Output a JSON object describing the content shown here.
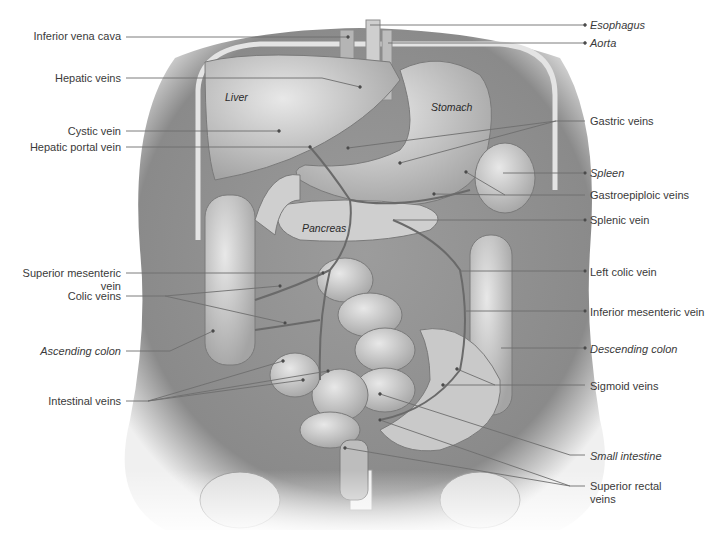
{
  "figure": {
    "title_visible": false,
    "colors": {
      "leader_line": "#6e6e6e",
      "label_text": "#3a3a3a",
      "illustration_dark": "#7a7a7a",
      "illustration_mid": "#a9a9a9",
      "illustration_light": "#d9d9d9",
      "background": "#ffffff"
    }
  },
  "organ_labels": [
    {
      "text": "Liver",
      "x": 225,
      "y": 91
    },
    {
      "text": "Stomach",
      "x": 431,
      "y": 101
    },
    {
      "text": "Pancreas",
      "x": 302,
      "y": 222
    }
  ],
  "labels_left": [
    {
      "text": "Inferior vena cava",
      "italic": false,
      "right": 121,
      "y": 30,
      "line": [
        126,
        37,
        348,
        37
      ]
    },
    {
      "text": "Hepatic veins",
      "italic": false,
      "right": 121,
      "y": 72,
      "line": [
        126,
        78,
        322,
        78,
        322,
        78,
        360,
        87
      ]
    },
    {
      "text": "Cystic vein",
      "italic": false,
      "right": 121,
      "y": 125,
      "line": [
        126,
        131,
        279,
        131
      ]
    },
    {
      "text": "Hepatic portal vein",
      "italic": false,
      "right": 121,
      "y": 141,
      "line": [
        126,
        147,
        310,
        147
      ]
    },
    {
      "text": "Superior mesenteric\nvein",
      "italic": false,
      "right": 121,
      "y": 267,
      "line": [
        126,
        273,
        323,
        273
      ]
    },
    {
      "text": "Colic veins",
      "italic": false,
      "right": 121,
      "y": 290,
      "line": [
        126,
        296,
        165,
        296,
        280,
        286
      ],
      "line2": [
        165,
        296,
        285,
        323
      ]
    },
    {
      "text": "Ascending colon",
      "italic": true,
      "right": 121,
      "y": 345,
      "line": [
        126,
        351,
        170,
        351,
        213,
        331
      ]
    },
    {
      "text": "Intestinal veins",
      "italic": false,
      "right": 121,
      "y": 395,
      "line": [
        126,
        401,
        148,
        401,
        283,
        361
      ],
      "line2": [
        148,
        401,
        303,
        380
      ],
      "line3": [
        148,
        401,
        328,
        371
      ]
    }
  ],
  "labels_right": [
    {
      "text": "Esophagus",
      "italic": true,
      "left": 590,
      "y": 19,
      "line": [
        370,
        25,
        585,
        25
      ]
    },
    {
      "text": "Aorta",
      "italic": true,
      "left": 590,
      "y": 37,
      "line": [
        388,
        43,
        585,
        43
      ]
    },
    {
      "text": "Gastric veins",
      "italic": false,
      "left": 590,
      "y": 115,
      "line": [
        585,
        121,
        556,
        121,
        348,
        148
      ],
      "line2": [
        556,
        121,
        400,
        163
      ]
    },
    {
      "text": "Spleen",
      "italic": true,
      "left": 590,
      "y": 167,
      "line": [
        503,
        173,
        585,
        173
      ]
    },
    {
      "text": "Gastroepiploic veins",
      "italic": false,
      "left": 590,
      "y": 189,
      "line": [
        585,
        195,
        505,
        195,
        466,
        172
      ],
      "line2": [
        505,
        195,
        434,
        194
      ]
    },
    {
      "text": "Splenic vein",
      "italic": false,
      "left": 590,
      "y": 214,
      "line": [
        393,
        220,
        585,
        220
      ]
    },
    {
      "text": "Left colic vein",
      "italic": false,
      "left": 590,
      "y": 266,
      "line": [
        460,
        271,
        585,
        271
      ]
    },
    {
      "text": "Inferior mesenteric vein",
      "italic": false,
      "left": 590,
      "y": 306,
      "line": [
        466,
        311,
        585,
        311
      ]
    },
    {
      "text": "Descending colon",
      "italic": true,
      "left": 590,
      "y": 343,
      "line": [
        501,
        348,
        585,
        348
      ]
    },
    {
      "text": "Sigmoid veins",
      "italic": false,
      "left": 590,
      "y": 380,
      "line": [
        585,
        385,
        495,
        385,
        457,
        369
      ],
      "line2": [
        495,
        385,
        443,
        385
      ]
    },
    {
      "text": "Small intestine",
      "italic": true,
      "left": 590,
      "y": 450,
      "line": [
        585,
        455,
        570,
        455,
        380,
        394
      ]
    },
    {
      "text": "Superior rectal\nveins",
      "italic": false,
      "left": 590,
      "y": 480,
      "line": [
        585,
        486,
        570,
        486,
        380,
        420
      ],
      "line2": [
        570,
        486,
        345,
        448
      ]
    }
  ]
}
